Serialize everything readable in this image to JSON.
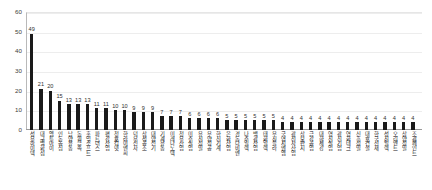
{
  "chart_data": {
    "type": "bar",
    "title": "",
    "xlabel": "",
    "ylabel": "",
    "ylim": [
      0,
      60
    ],
    "yticks": [
      0,
      10,
      20,
      30,
      40,
      50,
      60
    ],
    "grid": true,
    "legend": "none",
    "bar_color": "#1a1a1a",
    "categories": [
      "성우하이텍",
      "대구백화점",
      "엠투아이",
      "인동농심",
      "남양유통",
      "동원금속",
      "홍익소프트",
      "파트너스",
      "평강산업",
      "청호컴넷",
      "한라이앤씨",
      "덕우전자",
      "삼성공조",
      "대양전기",
      "기계유통",
      "미래나노텍",
      "청우산업",
      "미주실업",
      "유진정밀",
      "우양정공",
      "한신기계",
      "은화산업",
      "경동나비엔",
      "나주일렉",
      "백광산업",
      "태화일렉",
      "우진플라",
      "국영지앤엠",
      "광전자산업",
      "삼보판지",
      "금강공업",
      "대한제강",
      "영진실업",
      "광신기업",
      "영화테크",
      "신흥정밀",
      "대호건설",
      "한국선재",
      "성진일렉",
      "오리엔트",
      "삼양정밀",
      "조광페인트"
    ],
    "values": [
      49,
      21,
      20,
      15,
      13,
      13,
      13,
      11,
      11,
      10,
      10,
      9,
      9,
      9,
      7,
      7,
      7,
      6,
      6,
      6,
      6,
      5,
      5,
      5,
      5,
      5,
      5,
      4,
      4,
      4,
      4,
      4,
      4,
      4,
      4,
      4,
      4,
      4,
      4,
      4,
      4,
      4
    ],
    "value_labels": [
      "49",
      "21",
      "20",
      "15",
      "13",
      "13",
      "13",
      "11",
      "11",
      "10",
      "10",
      "9",
      "9",
      "9",
      "7",
      "7",
      "7",
      "6",
      "6",
      "6",
      "6",
      "5",
      "5",
      "5",
      "5",
      "5",
      "5",
      "4",
      "4",
      "4",
      "4",
      "4",
      "4",
      "4",
      "4",
      "4",
      "4",
      "4",
      "4",
      "4",
      "4",
      "4"
    ],
    "ytick_labels": [
      "0",
      "10",
      "20",
      "30",
      "40",
      "50",
      "60"
    ]
  }
}
